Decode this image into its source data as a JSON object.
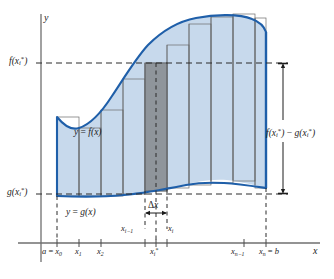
{
  "figure": {
    "kind": "riemann-sum-area-between-curves",
    "axes": {
      "x_label": "x",
      "y_label": "y"
    },
    "colors": {
      "curve": "#1f5fa9",
      "fill_light": "#c7d9ec",
      "fill_dark": "#8a8f94",
      "rect_stroke": "#6b6b6b",
      "axis": "#6f6f6f",
      "dashed": "#2a2a2a",
      "text": "#1c1c1c"
    },
    "labels": {
      "y_axis": "y",
      "x_axis": "x",
      "f_of_xi": "f(x*i)",
      "g_of_xi": "g(x*i)",
      "curve_f": "y = f(x)",
      "curve_g": "y = g(x)",
      "height_diff": "f(x*i) − g(x*i)",
      "delta_x": "Δx",
      "x_i_minus_1": "xi−1",
      "x_i": "xi",
      "x_i_star": "x*i",
      "a_eq_x0": "a = x0",
      "x1": "x1",
      "x2": "x2",
      "xn_minus_1": "xn−1",
      "xn_eq_b": "xn = b"
    },
    "ticks": [
      {
        "name": "a = x0",
        "x": 57
      },
      {
        "name": "x1",
        "x": 79
      },
      {
        "name": "x2",
        "x": 101
      },
      {
        "name": "x_i-1",
        "x": 145
      },
      {
        "name": "x_i*",
        "x": 156
      },
      {
        "name": "x_i",
        "x": 167
      },
      {
        "name": "x_n-1",
        "x": 244
      },
      {
        "name": "x_n = b",
        "x": 266
      }
    ],
    "guides": {
      "f_level_y": 63,
      "g_level_y": 194
    }
  }
}
